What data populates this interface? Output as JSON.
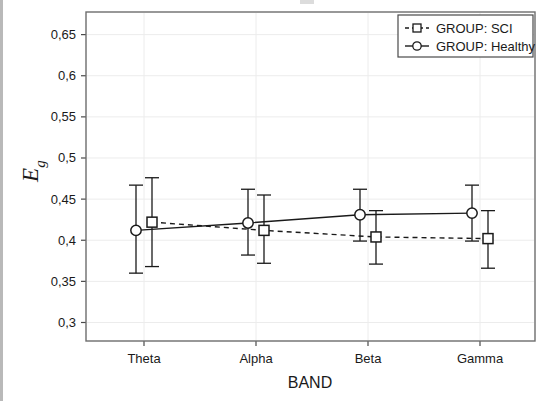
{
  "chart_data": {
    "type": "line",
    "title": "",
    "xlabel": "BAND",
    "ylabel": "Eg",
    "ylabel_base": "E",
    "ylabel_sub": "g",
    "categories": [
      "Theta",
      "Alpha",
      "Beta",
      "Gamma"
    ],
    "ytick_labels": [
      "0,3",
      "0,35",
      "0,4",
      "0,45",
      "0,5",
      "0,55",
      "0,6",
      "0,65"
    ],
    "ytick_values": [
      0.3,
      0.35,
      0.4,
      0.45,
      0.5,
      0.55,
      0.6,
      0.65
    ],
    "ylim": [
      0.2775,
      0.6775
    ],
    "grid": true,
    "legend_position": "top-right",
    "decimal_separator": ",",
    "error_bar_type": "mean with error bars",
    "series": [
      {
        "name": "GROUP: SCI",
        "legend_label": "GROUP: SCI",
        "marker": "square",
        "line_style": "dashed",
        "color": "#1a1a1a",
        "x_offset": 8,
        "values": [
          0.422,
          0.412,
          0.404,
          0.402
        ],
        "error_lower": [
          0.368,
          0.372,
          0.371,
          0.366
        ],
        "error_upper": [
          0.476,
          0.455,
          0.436,
          0.436
        ]
      },
      {
        "name": "GROUP: Healthy",
        "legend_label": "GROUP: Healthy",
        "marker": "circle",
        "line_style": "solid",
        "color": "#1a1a1a",
        "x_offset": -8,
        "values": [
          0.412,
          0.421,
          0.431,
          0.433
        ],
        "error_lower": [
          0.36,
          0.382,
          0.399,
          0.399
        ],
        "error_upper": [
          0.467,
          0.462,
          0.462,
          0.467
        ]
      }
    ]
  },
  "plot_area": {
    "left": 86,
    "top": 12,
    "right": 535,
    "bottom": 341,
    "frame_color": "#6d6d6d",
    "grid_color": "#ececec",
    "background": "#ffffff"
  }
}
